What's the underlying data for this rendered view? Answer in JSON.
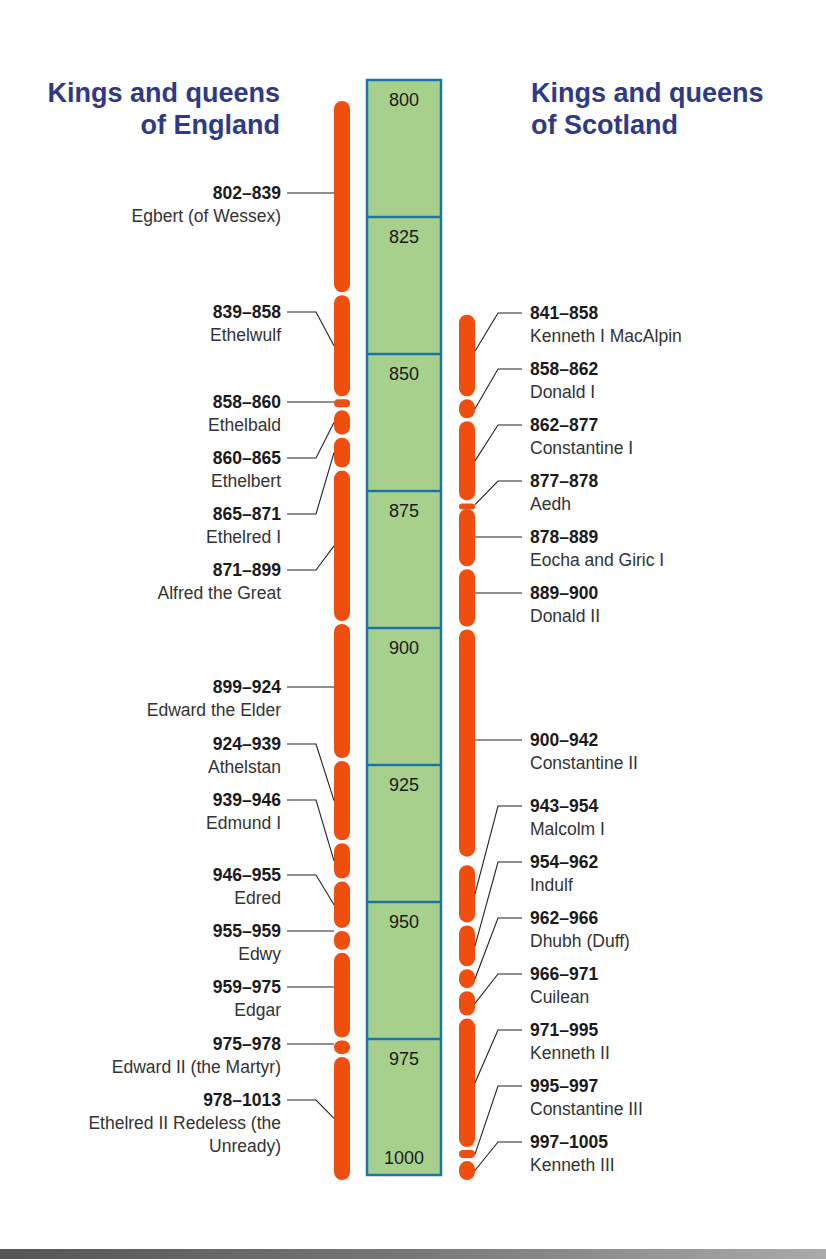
{
  "titles": {
    "england": "Kings and queens of England",
    "england_line1": "Kings and queens",
    "england_line2": "of England",
    "scotland_line1": "Kings and queens",
    "scotland_line2": "of Scotland"
  },
  "colors": {
    "title": "#2e3a86",
    "bar": "#f04e0f",
    "scale_fill": "#a8d08d",
    "scale_border": "#1d74a6",
    "leader": "#222222"
  },
  "chart_data": {
    "type": "timeline",
    "axis": {
      "start": 800,
      "end": 1000,
      "ticks": [
        800,
        825,
        850,
        875,
        900,
        925,
        950,
        975,
        1000
      ]
    },
    "series": [
      {
        "name": "Kings and queens of England",
        "reigns": [
          {
            "years": "802–839",
            "start": 802,
            "end": 839,
            "name": "Egbert (of Wessex)",
            "label_y": 182
          },
          {
            "years": "839–858",
            "start": 839,
            "end": 858,
            "name": "Ethelwulf",
            "label_y": 301
          },
          {
            "years": "858–860",
            "start": 858,
            "end": 860,
            "name": "Ethelbald",
            "label_y": 391
          },
          {
            "years": "860–865",
            "start": 860,
            "end": 865,
            "name": "Ethelbert",
            "label_y": 447
          },
          {
            "years": "865–871",
            "start": 865,
            "end": 871,
            "name": "Ethelred I",
            "label_y": 503
          },
          {
            "years": "871–899",
            "start": 871,
            "end": 899,
            "name": "Alfred the Great",
            "label_y": 559
          },
          {
            "years": "899–924",
            "start": 899,
            "end": 924,
            "name": "Edward the Elder",
            "label_y": 676
          },
          {
            "years": "924–939",
            "start": 924,
            "end": 939,
            "name": "Athelstan",
            "label_y": 733
          },
          {
            "years": "939–946",
            "start": 939,
            "end": 946,
            "name": "Edmund I",
            "label_y": 789
          },
          {
            "years": "946–955",
            "start": 946,
            "end": 955,
            "name": "Edred",
            "label_y": 864
          },
          {
            "years": "955–959",
            "start": 955,
            "end": 959,
            "name": "Edwy",
            "label_y": 920
          },
          {
            "years": "959–975",
            "start": 959,
            "end": 975,
            "name": "Edgar",
            "label_y": 976
          },
          {
            "years": "975–978",
            "start": 975,
            "end": 978,
            "name": "Edward II (the Martyr)",
            "label_y": 1033
          },
          {
            "years": "978–1013",
            "start": 978,
            "end": 1013,
            "name": "Ethelred II Redeless (the Unready)",
            "name_line1": "Ethelred II Redeless (the",
            "name_line2": "Unready)",
            "label_y": 1089
          }
        ]
      },
      {
        "name": "Kings and queens of Scotland",
        "reigns": [
          {
            "years": "841–858",
            "start": 841,
            "end": 858,
            "name": "Kenneth I MacAlpin",
            "label_y": 302
          },
          {
            "years": "858–862",
            "start": 858,
            "end": 862,
            "name": "Donald I",
            "label_y": 358
          },
          {
            "years": "862–877",
            "start": 862,
            "end": 877,
            "name": "Constantine I",
            "label_y": 414
          },
          {
            "years": "877–878",
            "start": 877,
            "end": 878,
            "name": "Aedh",
            "label_y": 470
          },
          {
            "years": "878–889",
            "start": 878,
            "end": 889,
            "name": "Eocha and Giric I",
            "label_y": 526
          },
          {
            "years": "889–900",
            "start": 889,
            "end": 900,
            "name": "Donald II",
            "label_y": 582
          },
          {
            "years": "900–942",
            "start": 900,
            "end": 942,
            "name": "Constantine II",
            "label_y": 729
          },
          {
            "years": "943–954",
            "start": 943,
            "end": 954,
            "name": "Malcolm I",
            "label_y": 795
          },
          {
            "years": "954–962",
            "start": 954,
            "end": 962,
            "name": "Indulf",
            "label_y": 851
          },
          {
            "years": "962–966",
            "start": 962,
            "end": 966,
            "name": "Dhubh (Duff)",
            "label_y": 907
          },
          {
            "years": "966–971",
            "start": 966,
            "end": 971,
            "name": "Cuilean",
            "label_y": 963
          },
          {
            "years": "971–995",
            "start": 971,
            "end": 995,
            "name": "Kenneth II",
            "label_y": 1019
          },
          {
            "years": "995–997",
            "start": 995,
            "end": 997,
            "name": "Constantine III",
            "label_y": 1075
          },
          {
            "years": "997–1005",
            "start": 997,
            "end": 1005,
            "name": "Kenneth III",
            "label_y": 1131
          }
        ]
      }
    ]
  }
}
